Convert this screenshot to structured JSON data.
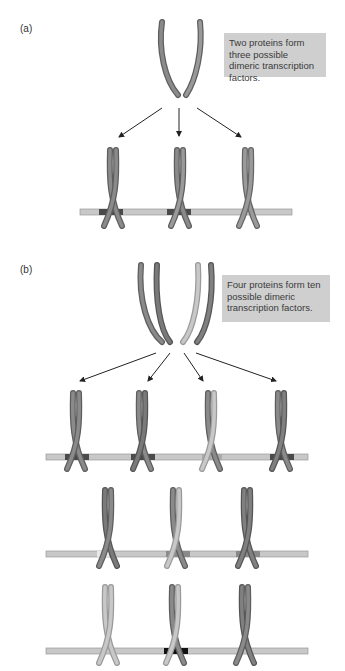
{
  "panel_a": {
    "label": "(a)",
    "note": "Two proteins form three possible dimeric transcription factors.",
    "proteins": [
      "dark",
      "medium"
    ],
    "dimers": [
      {
        "left": "dark",
        "right": "dark",
        "site": "dark"
      },
      {
        "left": "dark",
        "right": "medium",
        "site": "dark"
      },
      {
        "left": "medium",
        "right": "medium",
        "site": "none"
      }
    ]
  },
  "panel_b": {
    "label": "(b)",
    "note": "Four proteins form ten possible dimeric transcription factors.",
    "proteins": [
      "dark",
      "medium",
      "light",
      "darkgray"
    ],
    "dimers_row1": [
      {
        "left": "dark",
        "right": "dark",
        "site": "dark"
      },
      {
        "left": "dark",
        "right": "medium",
        "site": "dark"
      },
      {
        "left": "light",
        "right": "medium",
        "site": "light"
      },
      {
        "left": "dark",
        "right": "medium",
        "site": "dark"
      }
    ],
    "dimers_row2": [
      {
        "left": "dark",
        "right": "darkgray",
        "site": "light"
      },
      {
        "left": "light",
        "right": "medium",
        "site": "medium"
      },
      {
        "left": "darkgray",
        "right": "darkgray",
        "site": "medium"
      }
    ],
    "dimers_row3": [
      {
        "left": "light",
        "right": "light",
        "site": "none"
      },
      {
        "left": "dark",
        "right": "light",
        "site": "black"
      },
      {
        "left": "darkgray",
        "right": "dark",
        "site": "none"
      }
    ]
  },
  "colors": {
    "dark": "#7a7a7a",
    "medium": "#8e8e8e",
    "light": "#bdbdbd",
    "darkgray": "#6a6a6a",
    "dna": "#c8c8c8",
    "note_bg": "#cfcfcf",
    "arrow": "#222222"
  }
}
